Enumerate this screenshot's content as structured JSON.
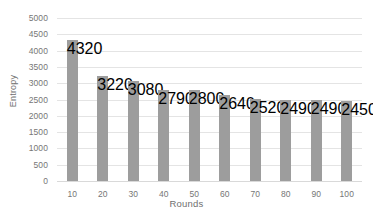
{
  "chart_data": {
    "type": "bar",
    "title": "",
    "xlabel": "Rounds",
    "ylabel": "Entropy",
    "categories": [
      "10",
      "20",
      "30",
      "40",
      "50",
      "60",
      "70",
      "80",
      "90",
      "100"
    ],
    "values": [
      4320,
      3220,
      3080,
      2790,
      2800,
      2640,
      2520,
      2490,
      2490,
      2450
    ],
    "series": [
      {
        "name": "Entropy",
        "values": [
          4320,
          3220,
          3080,
          2790,
          2800,
          2640,
          2520,
          2490,
          2490,
          2450
        ]
      }
    ],
    "ylim": [
      0,
      5000
    ],
    "ytick_step": 500,
    "ytick_labels": [
      "5000",
      "4500",
      "4000",
      "3500",
      "3000",
      "2500",
      "2000",
      "1500",
      "1000",
      "500",
      "0"
    ],
    "ytick_values": [
      5000,
      4500,
      4000,
      3500,
      3000,
      2500,
      2000,
      1500,
      1000,
      500,
      0
    ],
    "grid": true,
    "grid_axis": "y",
    "legend": false,
    "legend_position": "none",
    "bar_color": "#9d9d9d",
    "gridline_color": "#e4e4e4",
    "axis_text_color": "#767676",
    "background_color": "#ffffff"
  }
}
